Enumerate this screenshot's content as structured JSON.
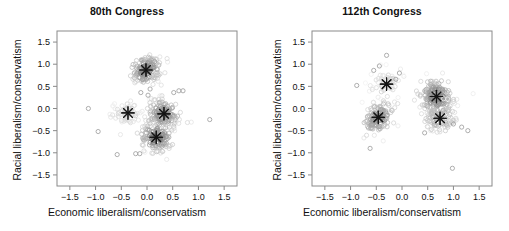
{
  "figure": {
    "background": "#ffffff",
    "panel_count": 2
  },
  "panels": [
    {
      "title": "80th Congress",
      "xlabel": "Economic liberalism/conservatism",
      "ylabel": "Racial liberalism/conservatism"
    },
    {
      "title": "112th Congress",
      "xlabel": "Economic liberalism/conservatism",
      "ylabel": "Racial liberalism/conservatism"
    }
  ],
  "chart_data": [
    {
      "type": "scatter",
      "title": "80th Congress",
      "xlabel": "Economic liberalism/conservatism",
      "ylabel": "Racial liberalism/conservatism",
      "xlim": [
        -1.75,
        1.75
      ],
      "ylim": [
        -1.75,
        1.75
      ],
      "xticks": [
        -1.5,
        -1.0,
        -0.5,
        0.0,
        0.5,
        1.0,
        1.5
      ],
      "yticks": [
        -1.5,
        -1.0,
        -0.5,
        0.0,
        0.5,
        1.0,
        1.5
      ],
      "xticklabels": [
        "-1.5",
        "-1.0",
        "-0.5",
        "0.0",
        "0.5",
        "1.0",
        "1.5"
      ],
      "yticklabels": [
        "-1.5",
        "-1.0",
        "-0.5",
        "0.0",
        "0.5",
        "1.0",
        "1.5"
      ],
      "grid": false,
      "legend": "none",
      "marker": "open-circle",
      "centroid_marker": "asterisk-star",
      "clusters": [
        {
          "name": "cluster-1",
          "center": [
            -0.02,
            0.87
          ],
          "n": 150,
          "sx": 0.14,
          "sy": 0.16,
          "shade": 0.62,
          "rot": -0.6
        },
        {
          "name": "cluster-2",
          "center": [
            -0.37,
            -0.1
          ],
          "n": 60,
          "sx": 0.16,
          "sy": 0.17,
          "shade": 0.18,
          "rot": 0.0
        },
        {
          "name": "cluster-3",
          "center": [
            0.33,
            -0.12
          ],
          "n": 140,
          "sx": 0.16,
          "sy": 0.17,
          "shade": 0.58,
          "rot": 0.4
        },
        {
          "name": "cluster-4",
          "center": [
            0.18,
            -0.65
          ],
          "n": 130,
          "sx": 0.15,
          "sy": 0.16,
          "shade": 0.66,
          "rot": 0.3
        }
      ],
      "outliers": [
        [
          1.22,
          -0.25
        ],
        [
          -0.58,
          -1.04
        ],
        [
          -0.22,
          -1.02
        ],
        [
          -0.14,
          -1.02
        ],
        [
          0.7,
          0.4
        ],
        [
          0.62,
          0.4
        ],
        [
          0.52,
          0.36
        ],
        [
          0.06,
          0.44
        ],
        [
          -1.14,
          0.0
        ],
        [
          -0.95,
          -0.52
        ],
        [
          -0.12,
          0.36
        ],
        [
          0.02,
          0.3
        ]
      ]
    },
    {
      "type": "scatter",
      "title": "112th Congress",
      "xlabel": "Economic liberalism/conservatism",
      "ylabel": "Racial liberalism/conservatism",
      "xlim": [
        -1.75,
        1.75
      ],
      "ylim": [
        -1.75,
        1.75
      ],
      "xticks": [
        -1.5,
        -1.0,
        -0.5,
        0.0,
        0.5,
        1.0,
        1.5
      ],
      "yticks": [
        -1.5,
        -1.0,
        -0.5,
        0.0,
        0.5,
        1.0,
        1.5
      ],
      "xticklabels": [
        "-1.5",
        "-1.0",
        "-0.5",
        "0.0",
        "0.5",
        "1.0",
        "1.5"
      ],
      "yticklabels": [
        "-1.5",
        "-1.0",
        "-0.5",
        "0.0",
        "0.5",
        "1.0",
        "1.5"
      ],
      "grid": false,
      "legend": "none",
      "marker": "open-circle",
      "centroid_marker": "asterisk-star",
      "clusters": [
        {
          "name": "cluster-1",
          "center": [
            -0.3,
            0.55
          ],
          "n": 55,
          "sx": 0.13,
          "sy": 0.17,
          "shade": 0.2,
          "rot": -0.7
        },
        {
          "name": "cluster-2",
          "center": [
            -0.46,
            -0.2
          ],
          "n": 130,
          "sx": 0.13,
          "sy": 0.19,
          "shade": 0.55,
          "rot": -0.5
        },
        {
          "name": "cluster-3",
          "center": [
            0.67,
            0.27
          ],
          "n": 170,
          "sx": 0.16,
          "sy": 0.19,
          "shade": 0.6,
          "rot": 0.2
        },
        {
          "name": "cluster-4",
          "center": [
            0.74,
            -0.22
          ],
          "n": 90,
          "sx": 0.16,
          "sy": 0.15,
          "shade": 0.4,
          "rot": 0.2
        }
      ],
      "outliers": [
        [
          0.98,
          -1.35
        ],
        [
          1.28,
          -0.5
        ],
        [
          1.16,
          -0.42
        ],
        [
          -0.62,
          -0.9
        ],
        [
          -0.3,
          1.2
        ],
        [
          -0.44,
          0.96
        ],
        [
          -0.55,
          0.86
        ],
        [
          -0.12,
          0.66
        ],
        [
          -0.88,
          0.52
        ],
        [
          -0.05,
          0.8
        ],
        [
          1.0,
          -0.35
        ],
        [
          0.44,
          -0.55
        ]
      ]
    }
  ]
}
